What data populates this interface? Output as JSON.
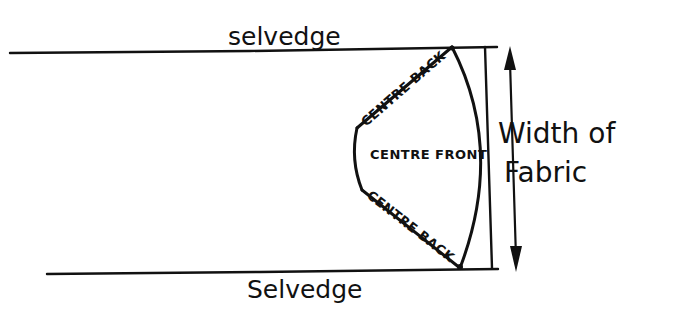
{
  "diagram": {
    "type": "pattern-layout",
    "labels": {
      "selvedge_top": "selvedge",
      "selvedge_bottom": "Selvedge",
      "width_line1": "Width of",
      "width_line2": "Fabric",
      "centre_back_top": "CENTRE BACK",
      "centre_front": "CENTRE FRONT",
      "centre_back_bottom": "CENTRE BACK"
    },
    "colors": {
      "ink": "#111111",
      "background": "#ffffff"
    },
    "elements": [
      {
        "id": "selvedge-top-line",
        "from": [
          10,
          53
        ],
        "to": [
          497,
          47
        ]
      },
      {
        "id": "selvedge-bottom-line",
        "from": [
          47,
          274
        ],
        "to": [
          498,
          269
        ]
      },
      {
        "id": "fabric-width-edge",
        "from": [
          485,
          47
        ],
        "to": [
          492,
          268
        ]
      },
      {
        "id": "width-arrow",
        "from": [
          510,
          50
        ],
        "to": [
          516,
          270
        ],
        "double_headed": true
      },
      {
        "id": "skirt-piece",
        "shape": "circular-skirt-wedge"
      }
    ]
  }
}
